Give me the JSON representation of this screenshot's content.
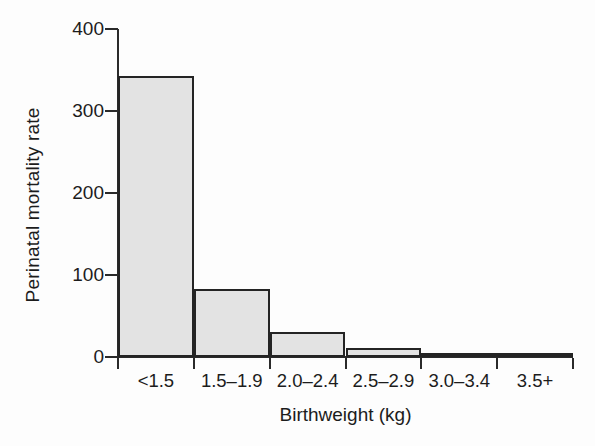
{
  "chart_data": {
    "type": "bar",
    "title": "",
    "subtitle": "",
    "xlabel": "Birthweight (kg)",
    "ylabel": "Perinatal mortality rate",
    "categories": [
      "<1.5",
      "1.5–1.9",
      "2.0–2.4",
      "2.5–2.9",
      "3.0–3.4",
      "3.5+"
    ],
    "values": [
      343,
      83,
      31,
      11,
      4,
      4
    ],
    "ylim": [
      0,
      400
    ],
    "yticks": [
      0,
      100,
      200,
      300,
      400
    ],
    "ytick_labels": [
      "0",
      "100",
      "200",
      "300",
      "400"
    ],
    "grid": false,
    "legend": false,
    "legend_position": "none",
    "series": [
      {
        "name": "Perinatal mortality rate",
        "values": [
          343,
          83,
          31,
          11,
          4,
          4
        ]
      }
    ],
    "annotations": [],
    "colors": {
      "bar_fill": "#e3e3e3",
      "bar_border": "#242424",
      "axis": "#2a2a2a",
      "text": "#1c1c1c",
      "background": "#fdfdfd"
    }
  }
}
